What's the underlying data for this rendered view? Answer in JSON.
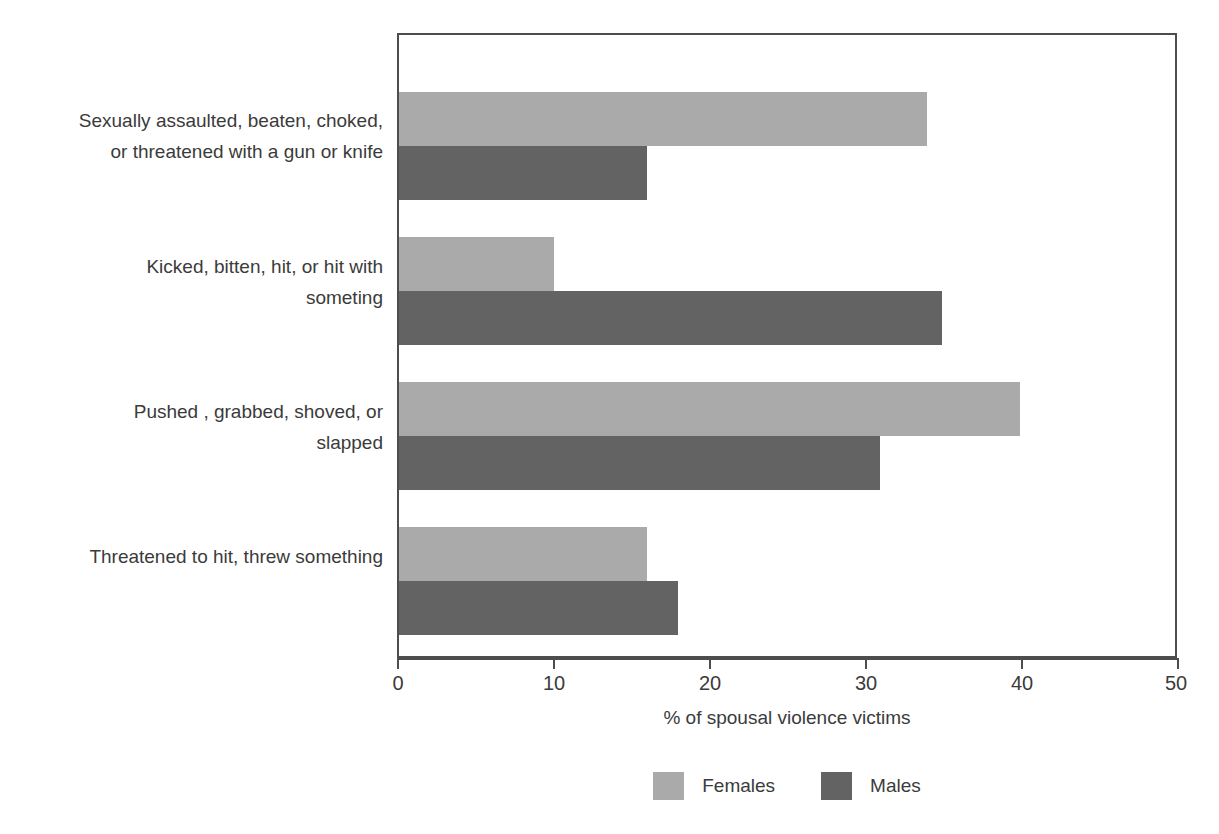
{
  "chart_data": {
    "type": "bar",
    "orientation": "horizontal",
    "title": "",
    "subtitle": "",
    "xlabel": "% of spousal violence victims",
    "ylabel": "",
    "xlim": [
      0,
      50
    ],
    "xticks": [
      0,
      10,
      20,
      30,
      40,
      50
    ],
    "xtick_labels": [
      "0",
      "10",
      "20",
      "30",
      "40",
      "50"
    ],
    "grid": false,
    "legend_position": "bottom-center",
    "categories": [
      "Sexually assaulted, beaten, choked,\nor threatened with a gun or knife",
      "Kicked, bitten, hit, or hit with\nsometing",
      "Pushed , grabbed, shoved, or\nslapped",
      "Threatened to hit, threw something"
    ],
    "series": [
      {
        "name": "Females",
        "color": "#aaaaaa",
        "values": [
          34,
          10,
          40,
          16
        ]
      },
      {
        "name": "Males",
        "color": "#636363",
        "values": [
          16,
          35,
          31,
          18
        ]
      }
    ]
  },
  "axis": {
    "frame_color": "#4d4d4d",
    "tick_label_color": "#3b3b3b"
  },
  "legend": {
    "items": [
      {
        "label": "Females",
        "color": "#aaaaaa"
      },
      {
        "label": "Males",
        "color": "#636363"
      }
    ]
  }
}
